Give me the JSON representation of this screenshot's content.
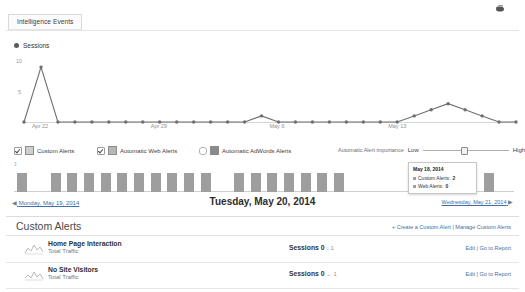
{
  "topbar": {
    "tab_label": "Intelligence Events",
    "share_icon": "share-icon"
  },
  "line_chart_legend": {
    "label": "Sessions"
  },
  "filters": {
    "items": [
      {
        "label": "Custom Alerts",
        "checked": true,
        "swatch": "#cfcfcf"
      },
      {
        "label": "Automatic Web Alerts",
        "checked": true,
        "swatch": "#b6b6b6"
      },
      {
        "label": "Automatic AdWords Alerts",
        "checked": false,
        "swatch": "#8a8a8a"
      }
    ],
    "importance_label": "Automatic Alert importance",
    "low_label": "Low",
    "high_label": "High",
    "slider_value": 45
  },
  "tooltip": {
    "date": "May 18, 2014",
    "rows": [
      {
        "label": "Custom Alerts:",
        "value": "2"
      },
      {
        "label": "Web Alerts:",
        "value": "0"
      }
    ]
  },
  "date_nav": {
    "prev_arrow": "◀",
    "prev_label": "Monday, May 19, 2014",
    "current_label": "Tuesday, May 20, 2014",
    "next_label": "Wednesday, May 21, 2014",
    "next_arrow": "▶"
  },
  "custom_alerts": {
    "title": "Custom Alerts",
    "create_link": "+ Create a Custom Alert",
    "separator": " | ",
    "manage_link": "Manage Custom Alerts",
    "rows": [
      {
        "name": "Home Page Interaction",
        "subtitle": "Total Traffic",
        "metric_label": "Sessions",
        "metric_value": "0",
        "delta": "↓ 1",
        "edit_label": "Edit",
        "actions_separator": " | ",
        "report_label": "Go to Report"
      },
      {
        "name": "No Site Visitors",
        "subtitle": "Total Traffic",
        "metric_label": "Sessions",
        "metric_value": "0",
        "delta": "← 1",
        "edit_label": "Edit",
        "actions_separator": " | ",
        "report_label": "Go to Report"
      }
    ]
  },
  "chart_data": [
    {
      "type": "line",
      "title": "Sessions",
      "xlabel": "",
      "ylabel": "Sessions",
      "ylim": [
        0,
        10
      ],
      "yticks": [
        5,
        10
      ],
      "ytick_labels": [
        "5",
        "10"
      ],
      "xticks": [
        "Apr 22",
        "Apr 29",
        "May 6",
        "May 13"
      ],
      "xtick_positions": [
        1,
        8,
        15,
        22
      ],
      "grid": false,
      "legend_position": "top-left",
      "x": [
        "Apr 21",
        "Apr 22",
        "Apr 23",
        "Apr 24",
        "Apr 25",
        "Apr 26",
        "Apr 27",
        "Apr 28",
        "Apr 29",
        "Apr 30",
        "May 1",
        "May 2",
        "May 3",
        "May 4",
        "May 5",
        "May 6",
        "May 7",
        "May 8",
        "May 9",
        "May 10",
        "May 11",
        "May 12",
        "May 13",
        "May 14",
        "May 15",
        "May 16",
        "May 17",
        "May 18",
        "May 19",
        "May 20"
      ],
      "values": [
        0,
        9,
        0,
        0,
        0,
        0,
        0,
        0,
        0,
        0,
        0,
        0,
        0,
        0,
        1,
        0,
        0,
        0,
        0,
        0,
        0,
        0,
        0,
        1,
        2,
        3,
        2,
        1,
        0,
        0
      ]
    },
    {
      "type": "bar",
      "title": "Alert events per day",
      "ylim": [
        0,
        3
      ],
      "ytick_labels": [
        "3"
      ],
      "categories": [
        "Apr 21",
        "Apr 22",
        "Apr 23",
        "Apr 24",
        "Apr 25",
        "Apr 26",
        "Apr 27",
        "Apr 28",
        "Apr 29",
        "Apr 30",
        "May 1",
        "May 2",
        "May 3",
        "May 4",
        "May 5",
        "May 6",
        "May 7",
        "May 8",
        "May 9",
        "May 10",
        "May 11",
        "May 12",
        "May 13",
        "May 14",
        "May 15",
        "May 16",
        "May 17",
        "May 18",
        "May 19",
        "May 20"
      ],
      "values": [
        2,
        0,
        2,
        2,
        2,
        2,
        2,
        2,
        2,
        2,
        2,
        2,
        0,
        2,
        2,
        2,
        2,
        2,
        2,
        2,
        0,
        0,
        0,
        0,
        0,
        0,
        0,
        2,
        2,
        0
      ],
      "grid": false,
      "legend_position": "none"
    }
  ]
}
